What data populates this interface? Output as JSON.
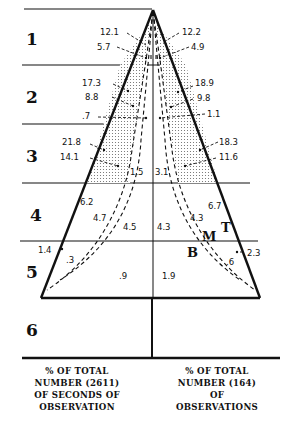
{
  "diagram": {
    "levels": [
      "1",
      "2",
      "3",
      "4",
      "5",
      "6"
    ],
    "zone_markers": {
      "top": "T",
      "middle": "M",
      "bottom": "B"
    },
    "left_values": {
      "level1": [
        "12.1",
        "5.7"
      ],
      "level2": [
        "17.3",
        "8.8",
        ".7"
      ],
      "level3": [
        "21.8",
        "14.1",
        "1.5"
      ],
      "level4": [
        "6.2",
        "4.7",
        "4.5"
      ],
      "level5": [
        "1.4",
        ".3",
        ".9"
      ]
    },
    "right_values": {
      "level1": [
        "12.2",
        "4.9"
      ],
      "level2": [
        "18.9",
        "9.8",
        "1.1"
      ],
      "level3": [
        "18.3",
        "11.6",
        "3.1"
      ],
      "level4": [
        "6.7",
        "4.3",
        "4.3"
      ],
      "level5": [
        "2.3",
        ".6",
        "1.9"
      ]
    },
    "captions": {
      "left": [
        "% OF TOTAL",
        "NUMBER (2611)",
        "OF SECONDS OF",
        "OBSERVATION"
      ],
      "right": [
        "% OF TOTAL",
        "NUMBER (164)",
        "OF",
        "OBSERVATIONS"
      ]
    },
    "colors": {
      "ink": "#111111",
      "paper": "#ffffff",
      "stipple": "#777777"
    }
  }
}
